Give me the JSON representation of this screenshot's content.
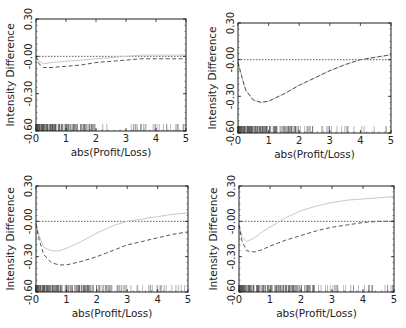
{
  "figure": {
    "panel_count": 4,
    "colors": {
      "frame": "#222222",
      "dotted_zero": "#333333",
      "solid_curve": "#c8c8c8",
      "dashed_curve": "#555555",
      "rug": "#555555"
    }
  },
  "chart_data": [
    {
      "type": "line",
      "panel": "top-left",
      "title": "",
      "xlabel": "abs(Profit/Loss)",
      "ylabel": "Intensity Difference",
      "xlim": [
        0,
        5
      ],
      "ylim": [
        -0.6,
        0.3
      ],
      "xticks": [
        "0",
        "1",
        "2",
        "3",
        "4",
        "5"
      ],
      "yticks": [
        "-0.60",
        "-0.30",
        "-0.00",
        "0.30"
      ],
      "reference_line": {
        "y": 0,
        "style": "dotted"
      },
      "x": [
        0,
        0.1,
        0.25,
        0.5,
        1,
        1.5,
        2,
        2.5,
        3,
        3.5,
        4,
        4.5,
        5
      ],
      "series": [
        {
          "name": "solid",
          "style": "solid",
          "values": [
            0.0,
            -0.04,
            -0.06,
            -0.05,
            -0.04,
            -0.03,
            -0.02,
            -0.01,
            0.0,
            0.01,
            0.01,
            0.01,
            0.01
          ]
        },
        {
          "name": "dashed",
          "style": "dashed",
          "values": [
            0.0,
            -0.06,
            -0.09,
            -0.09,
            -0.08,
            -0.07,
            -0.05,
            -0.04,
            -0.03,
            -0.02,
            -0.02,
            -0.02,
            -0.02
          ]
        }
      ],
      "rug": "dense 0–2, sparse 2–5"
    },
    {
      "type": "line",
      "panel": "top-right",
      "title": "",
      "xlabel": "abs(Profit/Loss)",
      "ylabel": "Intensity Difference",
      "xlim": [
        0,
        5
      ],
      "ylim": [
        -0.6,
        0.3
      ],
      "xticks": [
        "0",
        "1",
        "2",
        "3",
        "4",
        "5"
      ],
      "yticks": [
        "-0.60",
        "-0.30",
        "-0.00",
        "0.30"
      ],
      "reference_line": {
        "y": 0,
        "style": "dotted"
      },
      "x": [
        0,
        0.1,
        0.25,
        0.5,
        0.75,
        1,
        1.5,
        2,
        2.5,
        3,
        3.5,
        4,
        4.5,
        5
      ],
      "series": [
        {
          "name": "solid",
          "style": "solid",
          "values": [
            -0.02,
            -0.12,
            -0.25,
            -0.33,
            -0.35,
            -0.34,
            -0.28,
            -0.21,
            -0.15,
            -0.09,
            -0.04,
            0.0,
            0.02,
            0.04
          ]
        },
        {
          "name": "dashed",
          "style": "dashed",
          "values": [
            -0.02,
            -0.12,
            -0.25,
            -0.33,
            -0.35,
            -0.34,
            -0.28,
            -0.21,
            -0.15,
            -0.09,
            -0.04,
            0.0,
            0.02,
            0.04
          ]
        }
      ],
      "rug": "dense 0–2, sparse 2–5"
    },
    {
      "type": "line",
      "panel": "bottom-left",
      "title": "",
      "xlabel": "abs(Profit/Loss)",
      "ylabel": "Intensity Difference",
      "xlim": [
        0,
        5
      ],
      "ylim": [
        -0.6,
        0.3
      ],
      "xticks": [
        "0",
        "1",
        "2",
        "3",
        "4",
        "5"
      ],
      "yticks": [
        "-0.60",
        "-0.30",
        "-0.00",
        "0.30"
      ],
      "reference_line": {
        "y": 0,
        "style": "dotted"
      },
      "x": [
        0,
        0.1,
        0.25,
        0.5,
        0.75,
        1,
        1.5,
        2,
        2.5,
        3,
        3.5,
        4,
        4.5,
        5
      ],
      "series": [
        {
          "name": "solid",
          "style": "solid",
          "values": [
            -0.02,
            -0.12,
            -0.22,
            -0.25,
            -0.25,
            -0.23,
            -0.17,
            -0.1,
            -0.04,
            0.0,
            0.02,
            0.04,
            0.06,
            0.07
          ]
        },
        {
          "name": "dashed",
          "style": "dashed",
          "values": [
            -0.02,
            -0.15,
            -0.28,
            -0.35,
            -0.37,
            -0.37,
            -0.34,
            -0.3,
            -0.25,
            -0.2,
            -0.17,
            -0.14,
            -0.11,
            -0.09
          ]
        }
      ],
      "rug": "dense 0–2.5, sparse 2.5–5"
    },
    {
      "type": "line",
      "panel": "bottom-right",
      "title": "",
      "xlabel": "abs(Profit/Loss)",
      "ylabel": "Intensity Difference",
      "xlim": [
        0,
        5
      ],
      "ylim": [
        -0.6,
        0.3
      ],
      "xticks": [
        "0",
        "1",
        "2",
        "3",
        "4",
        "5"
      ],
      "yticks": [
        "-0.60",
        "-0.30",
        "-0.00",
        "0.30"
      ],
      "reference_line": {
        "y": 0,
        "style": "dotted"
      },
      "x": [
        0,
        0.1,
        0.25,
        0.5,
        0.75,
        1,
        1.5,
        2,
        2.5,
        3,
        3.5,
        4,
        4.5,
        5
      ],
      "series": [
        {
          "name": "solid",
          "style": "solid",
          "values": [
            -0.03,
            -0.13,
            -0.17,
            -0.14,
            -0.09,
            -0.05,
            0.03,
            0.09,
            0.13,
            0.16,
            0.18,
            0.19,
            0.2,
            0.21
          ]
        },
        {
          "name": "dashed",
          "style": "dashed",
          "values": [
            -0.03,
            -0.17,
            -0.25,
            -0.26,
            -0.24,
            -0.21,
            -0.16,
            -0.12,
            -0.08,
            -0.05,
            -0.03,
            -0.01,
            0.0,
            0.0
          ]
        }
      ],
      "rug": "dense 0–2.5, sparse 2.5–5"
    }
  ],
  "panels": [
    {
      "frame": {
        "x": 36,
        "y": 19,
        "w": 150,
        "h": 112
      },
      "ylabel": "Intensity Difference",
      "xlabel": "abs(Profit/Loss)"
    },
    {
      "frame": {
        "x": 238,
        "y": 23,
        "w": 153,
        "h": 110
      },
      "ylabel": "Intensity Difference",
      "xlabel": "abs(Profit/Loss)"
    },
    {
      "frame": {
        "x": 36,
        "y": 186,
        "w": 152,
        "h": 106
      },
      "ylabel": "Intensity Difference",
      "xlabel": "abs(Profit/Loss)"
    },
    {
      "frame": {
        "x": 239,
        "y": 186,
        "w": 155,
        "h": 106
      },
      "ylabel": "Intensity Difference",
      "xlabel": "abs(Profit/Loss)"
    }
  ]
}
